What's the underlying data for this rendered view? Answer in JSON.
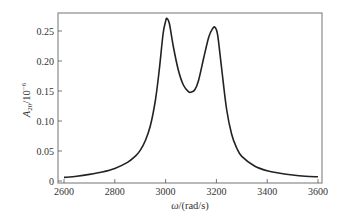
{
  "chart_data": {
    "type": "line",
    "title": "",
    "xlabel": "ω/(rad/s)",
    "ylabel": "A20/10^-6",
    "ylabel_parts": {
      "base": "A",
      "sub": "20",
      "mid": "/10",
      "sup": "−6"
    },
    "xlabel_parts": {
      "sym": "ω",
      "rest": "/(rad/s)"
    },
    "xlim": [
      2600,
      3600
    ],
    "ylim": [
      0,
      0.275
    ],
    "grid": false,
    "legend": null,
    "x_ticks": [
      2600,
      2800,
      3000,
      3200,
      3400,
      3600
    ],
    "x_tick_labels": [
      "2600",
      "2800",
      "3000",
      "3200",
      "3400",
      "3600"
    ],
    "y_ticks": [
      0,
      0.05,
      0.1,
      0.15,
      0.2,
      0.25
    ],
    "y_tick_labels": [
      "0",
      "0.05",
      "0.10",
      "0.15",
      "0.20",
      "0.25"
    ],
    "series": [
      {
        "name": "A20",
        "color": "#222222",
        "x": [
          2600,
          2650,
          2700,
          2750,
          2800,
          2850,
          2880,
          2900,
          2920,
          2940,
          2960,
          2975,
          2990,
          3000,
          3005,
          3015,
          3030,
          3050,
          3070,
          3090,
          3100,
          3115,
          3130,
          3150,
          3170,
          3185,
          3195,
          3205,
          3220,
          3240,
          3260,
          3280,
          3300,
          3350,
          3400,
          3450,
          3500,
          3550,
          3600
        ],
        "values": [
          0.006,
          0.008,
          0.011,
          0.015,
          0.021,
          0.031,
          0.041,
          0.051,
          0.067,
          0.092,
          0.135,
          0.185,
          0.245,
          0.266,
          0.271,
          0.262,
          0.225,
          0.185,
          0.16,
          0.149,
          0.148,
          0.152,
          0.168,
          0.205,
          0.24,
          0.254,
          0.256,
          0.243,
          0.19,
          0.12,
          0.078,
          0.055,
          0.041,
          0.025,
          0.017,
          0.013,
          0.01,
          0.008,
          0.007
        ]
      }
    ],
    "peaks": [
      {
        "x": 3005,
        "y": 0.271
      },
      {
        "x": 3195,
        "y": 0.256
      }
    ],
    "valley": {
      "x": 3100,
      "y": 0.148
    }
  },
  "layout": {
    "frame": {
      "left": 58,
      "top": 13,
      "right": 322,
      "bottom": 183
    },
    "x_px": {
      "origin": 64,
      "scale": 0.254,
      "x0": 2600
    },
    "y_px": {
      "origin": 181,
      "scale": 600
    }
  }
}
